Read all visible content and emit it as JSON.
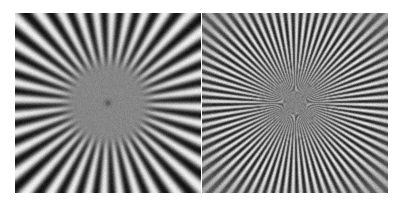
{
  "figure": {
    "background_color": "#ffffff",
    "width": 401,
    "height": 205,
    "panel_count": 2,
    "layout": "two panels side by side, separated by a thin white gutter"
  },
  "chart_data": {
    "type": "heatmap",
    "subtitle": "",
    "xlabel": "",
    "ylabel": "",
    "grid": false,
    "legend": "none",
    "colormap": "grayscale",
    "value_range": [
      0,
      255
    ],
    "panels": [
      {
        "name": "left-panel",
        "label": "",
        "description": "Low-frequency radial star: 36 alternating black/white spokes radiating from centre, smoothly blurred, with a flat uniform mid-grey disc covering the high-frequency core and a single small dark point at the exact centre.",
        "x": 15,
        "y": 13,
        "width": 186,
        "height": 180,
        "center_x": 93,
        "center_y": 90,
        "spokes": 36,
        "angular_period_deg": 10,
        "phase_deg": 0,
        "contrast": 1.0,
        "mean_level": 128,
        "blur_sigma_px": 1.6,
        "flat_core_radius_px": 45,
        "flat_core_feather_px": 14,
        "flat_core_level": 134,
        "center_dot_radius_px": 3,
        "center_dot_level": 72,
        "noise_amplitude": 7,
        "vignette": 0.0,
        "outer_falloff_radius_px": 0
      },
      {
        "name": "right-panel",
        "label": "",
        "description": "High-frequency radial star: 72 alternating spokes. Contrast is strongest in a mid annulus (radius ~25-62 px) and falls off toward both the centre and the outer corners, producing the classic aliasing / MTF fall-off appearance.",
        "x": 202,
        "y": 13,
        "width": 186,
        "height": 180,
        "center_x": 93,
        "center_y": 90,
        "spokes": 72,
        "angular_period_deg": 5,
        "phase_deg": 0,
        "contrast": 0.95,
        "mean_level": 130,
        "blur_sigma_px": 0.7,
        "flat_core_radius_px": 0,
        "flat_core_feather_px": 0,
        "flat_core_level": 130,
        "center_dot_radius_px": 0,
        "center_dot_level": 0,
        "noise_amplitude": 9,
        "vignette": 0.62,
        "peak_contrast_radius_px": 44,
        "inner_rolloff_radius_px": 20,
        "outer_falloff_radius_px": 66
      }
    ]
  }
}
